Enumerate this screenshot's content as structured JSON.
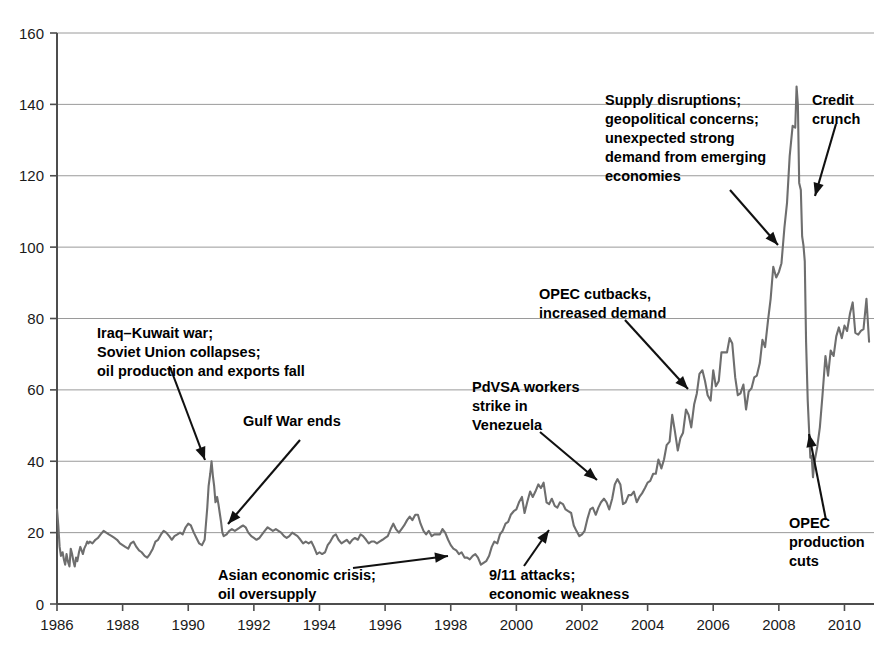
{
  "chart_data": {
    "type": "line",
    "title": "",
    "subtitle": "",
    "xlabel": "",
    "ylabel": "",
    "xlim": [
      1986,
      2010.9
    ],
    "ylim": [
      0,
      160
    ],
    "grid": true,
    "legend": "none",
    "y_ticks": [
      0,
      20,
      40,
      60,
      80,
      100,
      120,
      140,
      160
    ],
    "x_ticks": [
      1986,
      1988,
      1990,
      1992,
      1994,
      1996,
      1998,
      2000,
      2002,
      2004,
      2006,
      2008,
      2010
    ],
    "series": [
      {
        "name": "Crude oil price",
        "color": "#6e6e6e",
        "x": [
          1986.0,
          1986.04,
          1986.08,
          1986.12,
          1986.17,
          1986.21,
          1986.25,
          1986.29,
          1986.33,
          1986.38,
          1986.42,
          1986.46,
          1986.5,
          1986.54,
          1986.58,
          1986.62,
          1986.67,
          1986.71,
          1986.75,
          1986.79,
          1986.83,
          1986.88,
          1986.92,
          1986.96,
          1987.0,
          1987.08,
          1987.17,
          1987.25,
          1987.33,
          1987.42,
          1987.5,
          1987.58,
          1987.67,
          1987.75,
          1987.83,
          1987.92,
          1988.0,
          1988.08,
          1988.17,
          1988.25,
          1988.33,
          1988.42,
          1988.5,
          1988.58,
          1988.67,
          1988.75,
          1988.83,
          1988.92,
          1989.0,
          1989.08,
          1989.17,
          1989.25,
          1989.33,
          1989.42,
          1989.5,
          1989.58,
          1989.67,
          1989.75,
          1989.83,
          1989.92,
          1990.0,
          1990.08,
          1990.17,
          1990.25,
          1990.33,
          1990.42,
          1990.5,
          1990.58,
          1990.62,
          1990.67,
          1990.71,
          1990.75,
          1990.79,
          1990.83,
          1990.88,
          1990.92,
          1990.96,
          1991.0,
          1991.04,
          1991.08,
          1991.17,
          1991.25,
          1991.33,
          1991.42,
          1991.5,
          1991.58,
          1991.67,
          1991.75,
          1991.83,
          1991.92,
          1992.0,
          1992.08,
          1992.17,
          1992.25,
          1992.33,
          1992.42,
          1992.5,
          1992.58,
          1992.67,
          1992.75,
          1992.83,
          1992.92,
          1993.0,
          1993.08,
          1993.17,
          1993.25,
          1993.33,
          1993.42,
          1993.5,
          1993.58,
          1993.67,
          1993.75,
          1993.83,
          1993.92,
          1994.0,
          1994.08,
          1994.17,
          1994.25,
          1994.33,
          1994.42,
          1994.5,
          1994.58,
          1994.67,
          1994.75,
          1994.83,
          1994.92,
          1995.0,
          1995.08,
          1995.17,
          1995.25,
          1995.33,
          1995.42,
          1995.5,
          1995.58,
          1995.67,
          1995.75,
          1995.83,
          1995.92,
          1996.0,
          1996.08,
          1996.17,
          1996.25,
          1996.33,
          1996.42,
          1996.5,
          1996.58,
          1996.67,
          1996.75,
          1996.83,
          1996.92,
          1997.0,
          1997.08,
          1997.17,
          1997.25,
          1997.33,
          1997.42,
          1997.5,
          1997.58,
          1997.67,
          1997.75,
          1997.83,
          1997.92,
          1998.0,
          1998.08,
          1998.17,
          1998.25,
          1998.33,
          1998.42,
          1998.5,
          1998.58,
          1998.67,
          1998.75,
          1998.83,
          1998.92,
          1999.0,
          1999.08,
          1999.17,
          1999.25,
          1999.33,
          1999.42,
          1999.5,
          1999.58,
          1999.67,
          1999.75,
          1999.83,
          1999.92,
          2000.0,
          2000.08,
          2000.17,
          2000.25,
          2000.33,
          2000.42,
          2000.5,
          2000.58,
          2000.67,
          2000.75,
          2000.83,
          2000.92,
          2001.0,
          2001.08,
          2001.17,
          2001.25,
          2001.33,
          2001.42,
          2001.5,
          2001.58,
          2001.67,
          2001.75,
          2001.83,
          2001.92,
          2002.0,
          2002.08,
          2002.17,
          2002.25,
          2002.33,
          2002.42,
          2002.5,
          2002.58,
          2002.67,
          2002.75,
          2002.83,
          2002.92,
          2003.0,
          2003.08,
          2003.17,
          2003.25,
          2003.33,
          2003.42,
          2003.5,
          2003.58,
          2003.67,
          2003.75,
          2003.83,
          2003.92,
          2004.0,
          2004.08,
          2004.17,
          2004.25,
          2004.33,
          2004.42,
          2004.5,
          2004.58,
          2004.67,
          2004.75,
          2004.83,
          2004.92,
          2005.0,
          2005.08,
          2005.17,
          2005.25,
          2005.33,
          2005.42,
          2005.5,
          2005.58,
          2005.67,
          2005.75,
          2005.83,
          2005.92,
          2006.0,
          2006.08,
          2006.17,
          2006.25,
          2006.33,
          2006.42,
          2006.5,
          2006.58,
          2006.67,
          2006.75,
          2006.83,
          2006.92,
          2007.0,
          2007.08,
          2007.17,
          2007.25,
          2007.33,
          2007.42,
          2007.5,
          2007.58,
          2007.67,
          2007.75,
          2007.83,
          2007.92,
          2008.0,
          2008.08,
          2008.17,
          2008.25,
          2008.33,
          2008.42,
          2008.5,
          2008.54,
          2008.58,
          2008.62,
          2008.67,
          2008.71,
          2008.75,
          2008.79,
          2008.83,
          2008.88,
          2008.92,
          2008.96,
          2009.0,
          2009.04,
          2009.08,
          2009.17,
          2009.25,
          2009.33,
          2009.42,
          2009.5,
          2009.58,
          2009.67,
          2009.75,
          2009.83,
          2009.92,
          2010.0,
          2010.08,
          2010.17,
          2010.25,
          2010.33,
          2010.42,
          2010.5,
          2010.58,
          2010.67,
          2010.75
        ],
        "y": [
          26.5,
          22.0,
          16.0,
          13.5,
          14.5,
          12.5,
          11.0,
          14.0,
          12.0,
          10.5,
          15.5,
          14.0,
          12.0,
          10.5,
          13.0,
          12.0,
          14.5,
          16.0,
          15.0,
          14.0,
          15.5,
          16.5,
          17.5,
          17.0,
          17.5,
          17.0,
          18.0,
          18.5,
          19.5,
          20.5,
          20.0,
          19.5,
          19.0,
          18.5,
          18.0,
          17.0,
          16.5,
          16.0,
          15.5,
          17.0,
          17.5,
          16.0,
          15.0,
          14.5,
          13.5,
          13.0,
          14.0,
          15.5,
          17.5,
          18.0,
          19.5,
          20.5,
          20.0,
          19.0,
          18.0,
          19.0,
          19.5,
          20.0,
          19.5,
          21.5,
          22.5,
          22.0,
          20.0,
          18.5,
          17.0,
          16.5,
          18.0,
          27.0,
          33.0,
          36.5,
          40.0,
          36.0,
          33.0,
          28.5,
          30.0,
          28.0,
          25.5,
          23.0,
          20.0,
          19.0,
          19.5,
          20.5,
          21.0,
          20.5,
          21.0,
          21.5,
          22.0,
          21.5,
          20.0,
          19.0,
          18.5,
          18.0,
          18.5,
          19.5,
          20.5,
          21.5,
          21.0,
          20.5,
          21.0,
          20.5,
          20.0,
          19.0,
          18.5,
          19.0,
          20.0,
          19.5,
          19.0,
          18.0,
          17.0,
          17.5,
          17.0,
          17.5,
          16.0,
          14.0,
          14.5,
          14.0,
          14.5,
          16.5,
          17.5,
          19.0,
          19.5,
          18.0,
          17.0,
          17.5,
          18.0,
          17.0,
          18.0,
          18.5,
          18.0,
          19.5,
          19.0,
          18.0,
          17.0,
          17.5,
          17.5,
          17.0,
          17.5,
          18.0,
          18.5,
          19.0,
          21.0,
          22.5,
          21.0,
          20.0,
          21.0,
          22.0,
          23.5,
          24.5,
          23.5,
          25.0,
          25.0,
          22.5,
          20.5,
          19.5,
          20.5,
          19.0,
          19.5,
          19.5,
          19.5,
          21.0,
          20.0,
          18.0,
          16.5,
          15.5,
          15.0,
          14.0,
          14.5,
          13.0,
          13.0,
          12.5,
          13.5,
          14.0,
          13.0,
          11.0,
          11.5,
          12.0,
          13.5,
          16.0,
          17.5,
          17.0,
          19.5,
          20.5,
          22.5,
          23.0,
          25.0,
          26.0,
          26.5,
          28.5,
          30.0,
          25.5,
          28.5,
          31.5,
          30.0,
          31.5,
          33.5,
          32.5,
          34.0,
          28.5,
          28.0,
          29.5,
          27.5,
          27.0,
          28.5,
          28.0,
          26.5,
          26.0,
          25.5,
          22.0,
          20.5,
          19.0,
          19.5,
          20.5,
          24.0,
          26.5,
          27.0,
          25.0,
          27.0,
          28.5,
          29.5,
          28.5,
          26.5,
          29.5,
          33.5,
          35.0,
          33.5,
          28.0,
          28.5,
          30.5,
          30.5,
          31.5,
          28.5,
          30.0,
          31.0,
          32.5,
          34.0,
          34.5,
          36.5,
          36.5,
          40.5,
          38.0,
          40.5,
          44.5,
          45.5,
          53.0,
          48.5,
          43.0,
          46.5,
          48.0,
          54.5,
          53.0,
          49.5,
          56.0,
          59.0,
          64.5,
          65.5,
          62.5,
          58.5,
          57.0,
          65.5,
          61.0,
          62.5,
          70.5,
          70.5,
          70.5,
          74.5,
          73.0,
          63.5,
          58.5,
          59.0,
          61.5,
          54.5,
          59.5,
          60.5,
          63.5,
          64.0,
          67.5,
          74.0,
          72.0,
          79.5,
          85.5,
          94.5,
          91.5,
          93.0,
          95.5,
          105.5,
          112.5,
          125.5,
          134.0,
          133.5,
          145.0,
          140.0,
          118.0,
          116.0,
          103.0,
          100.5,
          96.0,
          73.5,
          57.0,
          49.0,
          41.0,
          41.5,
          35.5,
          39.5,
          44.0,
          49.5,
          58.5,
          69.5,
          64.0,
          71.0,
          69.5,
          75.0,
          77.5,
          74.5,
          78.0,
          76.5,
          81.5,
          84.5,
          76.0,
          75.5,
          76.5,
          77.0,
          85.5,
          73.5
        ]
      }
    ],
    "annotations": [
      {
        "id": "iraq-kuwait",
        "lines": [
          "Iraq–Kuwait war;",
          "Soviet Union collapses;",
          "oil production and exports fall"
        ],
        "x": 97,
        "y": 338,
        "align": "left"
      },
      {
        "id": "gulf-war-ends",
        "lines": [
          "Gulf War ends"
        ],
        "x": 243,
        "y": 426,
        "align": "left"
      },
      {
        "id": "asian-crisis",
        "lines": [
          "Asian economic crisis;",
          "oil oversupply"
        ],
        "x": 218,
        "y": 580,
        "align": "left"
      },
      {
        "id": "nine-eleven",
        "lines": [
          "9/11 attacks;",
          "economic weakness"
        ],
        "x": 489,
        "y": 580,
        "align": "left"
      },
      {
        "id": "pdvsa-strike",
        "lines": [
          "PdVSA workers",
          "strike in",
          "Venezuela"
        ],
        "x": 472,
        "y": 392,
        "align": "left"
      },
      {
        "id": "opec-cutbacks",
        "lines": [
          "OPEC cutbacks,",
          "increased demand"
        ],
        "x": 539,
        "y": 299,
        "align": "left"
      },
      {
        "id": "supply-disruptions",
        "lines": [
          "Supply disruptions;",
          "geopolitical concerns;",
          "unexpected strong",
          "demand from emerging",
          "economies"
        ],
        "x": 605,
        "y": 105,
        "align": "left"
      },
      {
        "id": "credit-crunch",
        "lines": [
          "Credit",
          "crunch"
        ],
        "x": 812,
        "y": 105,
        "align": "left"
      },
      {
        "id": "opec-production-cuts",
        "lines": [
          "OPEC",
          "production",
          "cuts"
        ],
        "x": 789,
        "y": 528,
        "align": "left"
      }
    ],
    "arrows": [
      {
        "id": "arrow-iraq-kuwait",
        "x1": 170,
        "y1": 367,
        "x2": 205,
        "y2": 460
      },
      {
        "id": "arrow-gulf-war-ends",
        "x1": 300,
        "y1": 440,
        "x2": 228,
        "y2": 524
      },
      {
        "id": "arrow-asian-crisis",
        "x1": 353,
        "y1": 568,
        "x2": 448,
        "y2": 556
      },
      {
        "id": "arrow-nine-eleven",
        "x1": 524,
        "y1": 566,
        "x2": 549,
        "y2": 530
      },
      {
        "id": "arrow-pdvsa-strike",
        "x1": 540,
        "y1": 432,
        "x2": 597,
        "y2": 480
      },
      {
        "id": "arrow-opec-cutbacks",
        "x1": 625,
        "y1": 320,
        "x2": 688,
        "y2": 389
      },
      {
        "id": "arrow-supply-disruptions",
        "x1": 730,
        "y1": 190,
        "x2": 778,
        "y2": 245
      },
      {
        "id": "arrow-credit-crunch",
        "x1": 836,
        "y1": 124,
        "x2": 815,
        "y2": 196
      },
      {
        "id": "arrow-opec-production-cuts",
        "x1": 826,
        "y1": 520,
        "x2": 809,
        "y2": 434
      }
    ]
  },
  "colors": {
    "series": "#6e6e6e",
    "gridline": "#9a9a9a",
    "axis": "#4d4d4d",
    "text": "#000000",
    "background": "#ffffff"
  }
}
